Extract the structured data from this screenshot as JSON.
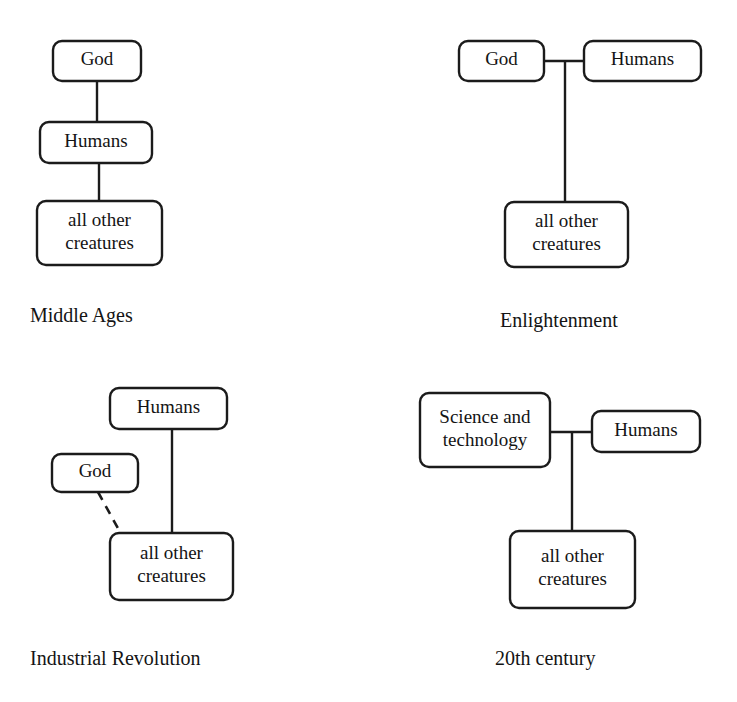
{
  "figure": {
    "background_color": "#ffffff",
    "line_color": "#1b1b1b",
    "text_color": "#141414"
  },
  "panels": [
    {
      "id": "middle-ages",
      "caption": "Middle Ages",
      "caption_x": 30,
      "caption_y": 322,
      "nodes": [
        {
          "id": "god",
          "label": "God",
          "lines": [
            "God"
          ],
          "x": 53,
          "y": 41,
          "w": 88,
          "h": 40
        },
        {
          "id": "humans",
          "label": "Humans",
          "lines": [
            "Humans"
          ],
          "x": 40,
          "y": 122,
          "w": 112,
          "h": 41
        },
        {
          "id": "creatures",
          "label": "all other creatures",
          "lines": [
            "all other",
            "creatures"
          ],
          "x": 37,
          "y": 201,
          "w": 125,
          "h": 64
        }
      ],
      "connectors": [
        {
          "id": "god-to-humans",
          "style": "solid",
          "points": "97,81 97,122"
        },
        {
          "id": "humans-to-creatures",
          "style": "solid",
          "points": "99,163 99,201"
        }
      ]
    },
    {
      "id": "enlightenment",
      "caption": "Enlightenment",
      "caption_x": 500,
      "caption_y": 327,
      "nodes": [
        {
          "id": "god",
          "label": "God",
          "lines": [
            "God"
          ],
          "x": 459,
          "y": 41,
          "w": 85,
          "h": 40
        },
        {
          "id": "humans",
          "label": "Humans",
          "lines": [
            "Humans"
          ],
          "x": 584,
          "y": 41,
          "w": 117,
          "h": 40
        },
        {
          "id": "creatures",
          "label": "all other creatures",
          "lines": [
            "all other",
            "creatures"
          ],
          "x": 505,
          "y": 202,
          "w": 123,
          "h": 65
        }
      ],
      "connectors": [
        {
          "id": "god-to-humans",
          "style": "solid",
          "points": "544,61 584,61"
        },
        {
          "id": "junction-to-creatures",
          "style": "solid",
          "points": "565,61 565,202"
        }
      ]
    },
    {
      "id": "industrial-revolution",
      "caption": "Industrial Revolution",
      "caption_x": 30,
      "caption_y": 665,
      "nodes": [
        {
          "id": "humans",
          "label": "Humans",
          "lines": [
            "Humans"
          ],
          "x": 110,
          "y": 388,
          "w": 117,
          "h": 41
        },
        {
          "id": "god",
          "label": "God",
          "lines": [
            "God"
          ],
          "x": 52,
          "y": 454,
          "w": 86,
          "h": 38
        },
        {
          "id": "creatures",
          "label": "all other creatures",
          "lines": [
            "all other",
            "creatures"
          ],
          "x": 110,
          "y": 533,
          "w": 123,
          "h": 67
        }
      ],
      "connectors": [
        {
          "id": "humans-to-creatures",
          "style": "solid",
          "points": "172,429 172,533"
        },
        {
          "id": "god-to-creatures",
          "style": "dashed",
          "points": "98,492 120,532"
        }
      ]
    },
    {
      "id": "20th-century",
      "caption": "20th century",
      "caption_x": 495,
      "caption_y": 665,
      "nodes": [
        {
          "id": "science",
          "label": "Science and technology",
          "lines": [
            "Science and",
            "technology"
          ],
          "x": 420,
          "y": 393,
          "w": 130,
          "h": 74
        },
        {
          "id": "humans",
          "label": "Humans",
          "lines": [
            "Humans"
          ],
          "x": 592,
          "y": 411,
          "w": 108,
          "h": 41
        },
        {
          "id": "creatures",
          "label": "all other creatures",
          "lines": [
            "all other",
            "creatures"
          ],
          "x": 510,
          "y": 531,
          "w": 125,
          "h": 77
        }
      ],
      "connectors": [
        {
          "id": "science-to-humans",
          "style": "solid",
          "points": "550,432 592,432"
        },
        {
          "id": "junction-to-creatures",
          "style": "solid",
          "points": "572,432 572,531"
        }
      ]
    }
  ]
}
